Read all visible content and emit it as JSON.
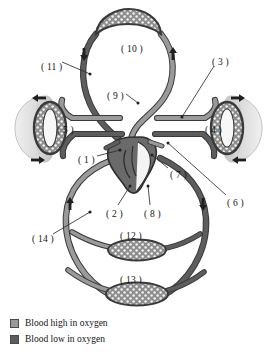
{
  "figure": {
    "background_color": "#ffffff"
  },
  "colors": {
    "oxygen_high": "#9a9a9a",
    "oxygen_low": "#5d5d5d",
    "vessel_outline": "#3a3a3a",
    "capillary_fill": "#8d8d8d",
    "lung_fill": "#d8d8d8",
    "heart_fill": "#6a6a6a",
    "label_text": "#141414",
    "leader_line": "#2e2e2e",
    "arrow": "#1f1f1f"
  },
  "labels": [
    {
      "id": "label-1",
      "text": "( 1 )",
      "x": 78,
      "y": 156
    },
    {
      "id": "label-2",
      "text": "( 2 )",
      "x": 106,
      "y": 210
    },
    {
      "id": "label-3",
      "text": "( 3 )",
      "x": 212,
      "y": 58
    },
    {
      "id": "label-4",
      "text": "( 4 )",
      "x": 205,
      "y": 126
    },
    {
      "id": "label-5",
      "text": "( 5 )",
      "x": 57,
      "y": 126
    },
    {
      "id": "label-6",
      "text": "( 6 )",
      "x": 227,
      "y": 199
    },
    {
      "id": "label-7",
      "text": "( 7 )",
      "x": 170,
      "y": 171
    },
    {
      "id": "label-8",
      "text": "( 8 )",
      "x": 144,
      "y": 210
    },
    {
      "id": "label-9",
      "text": "( 9 )",
      "x": 107,
      "y": 92
    },
    {
      "id": "label-10",
      "text": "( 10 )",
      "x": 121,
      "y": 45
    },
    {
      "id": "label-11",
      "text": "( 11 )",
      "x": 41,
      "y": 63
    },
    {
      "id": "label-12",
      "text": "( 12 )",
      "x": 120,
      "y": 232
    },
    {
      "id": "label-13",
      "text": "( 13 )",
      "x": 120,
      "y": 276
    },
    {
      "id": "label-14",
      "text": "( 14 )",
      "x": 32,
      "y": 235
    }
  ],
  "legend": {
    "items": [
      {
        "label": "Blood high in oxygen",
        "color": "#9a9a9a",
        "swatch_name": "legend-swatch-oxygen-high"
      },
      {
        "label": "Blood low in oxygen",
        "color": "#5d5d5d",
        "swatch_name": "legend-swatch-oxygen-low"
      }
    ]
  },
  "flow_arrows": [
    {
      "name": "arrow-upper-left-down",
      "direction": "down",
      "x": 84,
      "y": 55
    },
    {
      "name": "arrow-upper-right-up",
      "direction": "up",
      "x": 173,
      "y": 55
    },
    {
      "name": "arrow-left-lung-top",
      "direction": "left",
      "x": 38,
      "y": 98
    },
    {
      "name": "arrow-right-lung-top",
      "direction": "right",
      "x": 239,
      "y": 98
    },
    {
      "name": "arrow-left-lung-bottom",
      "direction": "right",
      "x": 38,
      "y": 160
    },
    {
      "name": "arrow-right-lung-bottom",
      "direction": "left",
      "x": 239,
      "y": 160
    },
    {
      "name": "arrow-lower-left-up",
      "direction": "up",
      "x": 70,
      "y": 205
    },
    {
      "name": "arrow-lower-right-down",
      "direction": "down",
      "x": 203,
      "y": 205
    }
  ],
  "structures": {
    "capillary_beds": [
      {
        "name": "capillary-bed-head",
        "label_ref": "( 10 )"
      },
      {
        "name": "capillary-bed-left-lung",
        "label_ref": "( 5 )"
      },
      {
        "name": "capillary-bed-right-lung",
        "label_ref": "( 4 )"
      },
      {
        "name": "capillary-bed-upper-body",
        "label_ref": "( 12 )"
      },
      {
        "name": "capillary-bed-lower-body",
        "label_ref": "( 13 )"
      }
    ],
    "organs": [
      {
        "name": "left-lung"
      },
      {
        "name": "right-lung"
      },
      {
        "name": "heart"
      }
    ]
  }
}
